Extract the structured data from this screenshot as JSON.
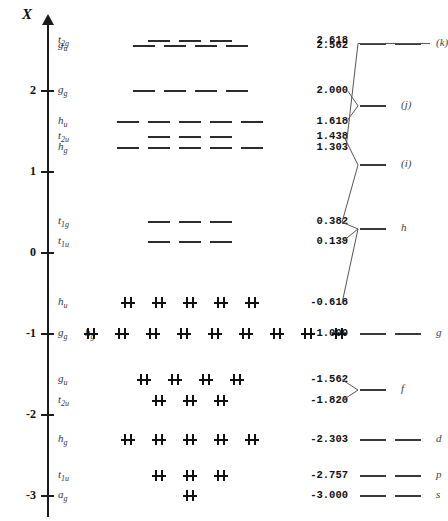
{
  "figure": {
    "axis_title": "X",
    "y_ticks": [
      {
        "label": "2",
        "value": 2
      },
      {
        "label": "1",
        "value": 1
      },
      {
        "label": "0",
        "value": 0
      },
      {
        "label": "-1",
        "value": -1
      },
      {
        "label": "-2",
        "value": -2
      },
      {
        "label": "-3",
        "value": -3
      }
    ],
    "axis_range": [
      -3.15,
      2.85
    ]
  },
  "levels": [
    {
      "sym": "t",
      "sub": "2g",
      "value": "2.618",
      "x": 2.618,
      "degeneracy": 3,
      "electron_pairs": 0
    },
    {
      "sym": "g",
      "sub": "u",
      "value": "2.562",
      "x": 2.562,
      "degeneracy": 4,
      "electron_pairs": 0
    },
    {
      "sym": "g",
      "sub": "g",
      "value": "2.000",
      "x": 2.0,
      "degeneracy": 4,
      "electron_pairs": 0
    },
    {
      "sym": "h",
      "sub": "u",
      "value": "1.618",
      "x": 1.618,
      "degeneracy": 5,
      "electron_pairs": 0
    },
    {
      "sym": "t",
      "sub": "2u",
      "value": "1.438",
      "x": 1.438,
      "degeneracy": 3,
      "electron_pairs": 0
    },
    {
      "sym": "h",
      "sub": "g",
      "value": "1.303",
      "x": 1.303,
      "degeneracy": 5,
      "electron_pairs": 0
    },
    {
      "sym": "t",
      "sub": "1g",
      "value": "0.382",
      "x": 0.382,
      "degeneracy": 3,
      "electron_pairs": 0
    },
    {
      "sym": "t",
      "sub": "1u",
      "value": "0.139",
      "x": 0.139,
      "degeneracy": 3,
      "electron_pairs": 0
    },
    {
      "sym": "h",
      "sub": "u",
      "value": "-0.618",
      "x": -0.618,
      "degeneracy": 5,
      "electron_pairs": 5
    },
    {
      "sym": "g",
      "sub": "g",
      "value": "-1.000",
      "x": -1.0,
      "degeneracy": 9,
      "electron_pairs": 9,
      "sym2": "h",
      "sub2": "g"
    },
    {
      "sym": "g",
      "sub": "u",
      "value": "-1.562",
      "x": -1.562,
      "degeneracy": 4,
      "electron_pairs": 4
    },
    {
      "sym": "t",
      "sub": "2u",
      "value": "-1.820",
      "x": -1.82,
      "degeneracy": 3,
      "electron_pairs": 3
    },
    {
      "sym": "h",
      "sub": "g",
      "value": "-2.303",
      "x": -2.303,
      "degeneracy": 5,
      "electron_pairs": 5
    },
    {
      "sym": "t",
      "sub": "1u",
      "value": "-2.757",
      "x": -2.757,
      "degeneracy": 3,
      "electron_pairs": 3
    },
    {
      "sym": "a",
      "sub": "g",
      "value": "-3.000",
      "x": -3.0,
      "degeneracy": 1,
      "electron_pairs": 1
    }
  ],
  "right_levels": [
    {
      "label": "(k)",
      "x": 2.59,
      "segments": 2
    },
    {
      "label": "(j)",
      "x": 1.82,
      "segments": 1
    },
    {
      "label": "(i)",
      "x": 1.09,
      "segments": 1
    },
    {
      "label": "h",
      "x": 0.3,
      "segments": 1
    },
    {
      "label": "g",
      "x": -1.0,
      "segments": 2
    },
    {
      "label": "f",
      "x": -1.69,
      "segments": 1
    },
    {
      "label": "d",
      "x": -2.303,
      "segments": 2
    },
    {
      "label": "p",
      "x": -2.757,
      "segments": 2
    },
    {
      "label": "s",
      "x": -3.0,
      "segments": 2
    }
  ],
  "chart_data": {
    "type": "line",
    "title": "",
    "xlabel": "",
    "ylabel": "X",
    "ylim": [
      -3.15,
      2.85
    ],
    "grid": false,
    "legend": "none",
    "categories": [
      "t2g",
      "gu",
      "gg",
      "hu",
      "t2u",
      "hg",
      "t1g",
      "t1u",
      "hu",
      "gg+hg",
      "gu",
      "t2u",
      "hg",
      "t1u",
      "ag"
    ],
    "values": [
      2.618,
      2.562,
      2.0,
      1.618,
      1.438,
      1.303,
      0.382,
      0.139,
      -0.618,
      -1.0,
      -1.562,
      -1.82,
      -2.303,
      -2.757,
      -3.0
    ],
    "series": [
      {
        "name": "degeneracy",
        "values": [
          3,
          4,
          4,
          5,
          3,
          5,
          3,
          3,
          5,
          9,
          4,
          3,
          5,
          3,
          1
        ]
      },
      {
        "name": "electron_pairs",
        "values": [
          0,
          0,
          0,
          0,
          0,
          0,
          0,
          0,
          5,
          9,
          4,
          3,
          5,
          3,
          1
        ]
      }
    ],
    "annotations": [
      "(k)",
      "(j)",
      "(i)",
      "h",
      "g",
      "f",
      "d",
      "p",
      "s"
    ]
  }
}
